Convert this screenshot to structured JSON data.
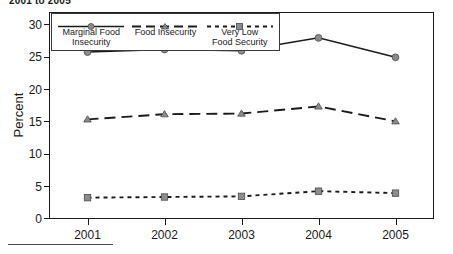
{
  "title_fragment": "2001 to 2005",
  "chart_data": {
    "type": "line",
    "title": "2001 to 2005",
    "xlabel": "",
    "ylabel": "Percent",
    "categories": [
      "2001",
      "2002",
      "2003",
      "2004",
      "2005"
    ],
    "x": [
      2001,
      2002,
      2003,
      2004,
      2005
    ],
    "ylim": [
      0,
      32
    ],
    "yticks": [
      0,
      5,
      10,
      15,
      20,
      25,
      30
    ],
    "ytick_labels": [
      "0",
      "5",
      "10",
      "15",
      "20",
      "25",
      "30"
    ],
    "grid": false,
    "legend_position": "top-left-inside",
    "series": [
      {
        "name": "Marginal Food Insecurity",
        "label_lines": "Marginal Food\nInsecurity",
        "values": [
          25.8,
          26.2,
          26.0,
          28.0,
          25.0
        ],
        "line_style": "solid",
        "marker": "circle",
        "color": "#1a1a1a",
        "marker_color": "#8c8c8c"
      },
      {
        "name": "Food Insecurity",
        "label_lines": "Food Insecurity",
        "values": [
          15.4,
          16.2,
          16.3,
          17.4,
          15.1
        ],
        "line_style": "dashed",
        "marker": "triangle",
        "color": "#1a1a1a",
        "marker_color": "#8c8c8c"
      },
      {
        "name": "Very Low Food Security",
        "label_lines": "Very Low\nFood Security",
        "values": [
          3.3,
          3.4,
          3.5,
          4.3,
          4.0
        ],
        "line_style": "dotted",
        "marker": "square",
        "color": "#1a1a1a",
        "marker_color": "#8c8c8c"
      }
    ]
  }
}
